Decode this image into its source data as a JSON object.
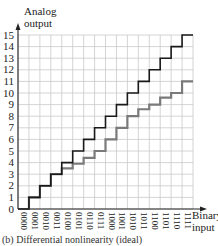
{
  "chart_data": {
    "type": "line",
    "subtype": "step",
    "title": "",
    "caption": "(b) Differential nonlinearity (ideal)",
    "xlabel": "Binary input",
    "ylabel": "Analog output",
    "categories": [
      "0000",
      "0001",
      "0010",
      "0011",
      "0100",
      "0101",
      "0110",
      "0111",
      "1000",
      "1001",
      "1010",
      "1011",
      "1100",
      "1101",
      "1110",
      "1111"
    ],
    "yticks": [
      0,
      1,
      2,
      3,
      4,
      5,
      6,
      7,
      8,
      9,
      10,
      11,
      12,
      13,
      14,
      15
    ],
    "ylim": [
      0,
      15
    ],
    "grid": true,
    "series": [
      {
        "name": "Ideal",
        "color": "#1a1a1a",
        "values": [
          0,
          1,
          2,
          3,
          4,
          5,
          6,
          7,
          8,
          9,
          10,
          11,
          12,
          13,
          14,
          15
        ]
      },
      {
        "name": "Nonlinear",
        "color": "#7a7a7a",
        "values": [
          0,
          1,
          2,
          3,
          3.5,
          3.9,
          4.4,
          5,
          6,
          7,
          8,
          8.6,
          9,
          9.6,
          10,
          11
        ]
      }
    ]
  },
  "axis": {
    "y_title_line1": "Analog",
    "y_title_line2": "output",
    "x_title_line1": "Binary",
    "x_title_line2": "input"
  }
}
